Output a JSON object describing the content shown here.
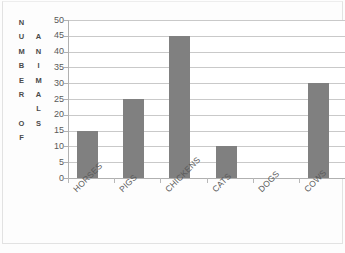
{
  "chart_data": {
    "type": "bar",
    "title": "",
    "subtitle": "",
    "xlabel": "",
    "ylabel": "NUMBER OF ANIMALS",
    "ylabel_columns": [
      [
        "N",
        "U",
        "M",
        "B",
        "E",
        "R",
        "",
        "O",
        "F"
      ],
      [
        "",
        "A",
        "N",
        "I",
        "M",
        "A",
        "L",
        "S",
        ""
      ]
    ],
    "categories": [
      "HORSES",
      "PIGS",
      "CHICKENS",
      "CATS",
      "DOGS",
      "COWS"
    ],
    "values": [
      15,
      25,
      45,
      10,
      0,
      30
    ],
    "ylim": [
      0,
      50
    ],
    "ytick_step": 5,
    "yticks": [
      50,
      45,
      40,
      35,
      30,
      25,
      20,
      15,
      10,
      5,
      0
    ],
    "grid": true,
    "grid_axis": "y",
    "legend": false,
    "legend_position": "none",
    "bar_color": "#808080",
    "gridline_color": "#c9c9c9",
    "axis_color": "#b0b0b0",
    "background_color": "#ffffff",
    "text_color": "#595959"
  }
}
